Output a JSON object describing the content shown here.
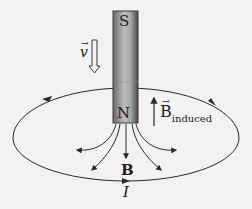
{
  "diagram": {
    "type": "physics-electromagnetic-induction",
    "magnet": {
      "top_pole_label": "S",
      "bottom_pole_label": "N"
    },
    "velocity": {
      "symbol": "v",
      "vector_mark": "→",
      "direction": "down"
    },
    "induced_field": {
      "symbol": "B",
      "vector_mark": "→",
      "subscript": "induced",
      "direction": "up"
    },
    "magnet_field": {
      "symbol": "B",
      "direction": "down, fanning out from N pole"
    },
    "current": {
      "symbol": "I",
      "direction": "counter-clockwise seen from above (rightward at front of loop)"
    },
    "colors": {
      "background": "#f2f2f2",
      "lines": "#2a2a2a",
      "magnet_dark": "#5a5a5a",
      "magnet_light": "#c8c8c8"
    }
  }
}
